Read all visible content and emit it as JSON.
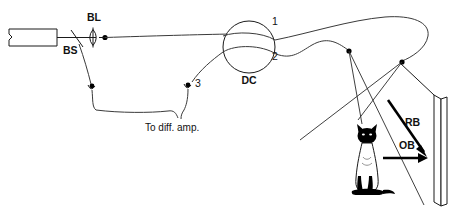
{
  "figure": {
    "background_color": "#ffffff",
    "ink_color": "#1a1a1a"
  },
  "labels": {
    "beam_splitter": "BS",
    "beam_lens": "BL",
    "directional_coupler": "DC",
    "port_1": "1",
    "port_2": "2",
    "port_3": "3",
    "diff_amp": "To diff. amp.",
    "reference_beam": "RB",
    "object_beam": "OB"
  },
  "components": {
    "laser": "laser-source",
    "beam_splitter": "beam-splitter",
    "lens": "coupling-lens",
    "coupler": "directional-coupler",
    "detector_a": "detector-bs-branch",
    "detector_b": "detector-port-3",
    "fiber_tip_upper": "fiber-tip-reference",
    "fiber_tip_lower": "fiber-tip-object",
    "object": "cat-object",
    "plate": "holographic-plate"
  },
  "caption": {
    "text": ""
  }
}
